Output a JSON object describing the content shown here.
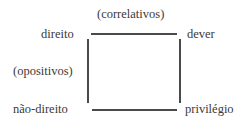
{
  "diagram": {
    "title_top": "(correlativos)",
    "title_left": "(opositivos)",
    "corners": {
      "top_left": "direito",
      "top_right": "dever",
      "bottom_left": "não-direito",
      "bottom_right": "privilégio"
    },
    "line_color": "#4a4a4a",
    "text_color": "#3a3a3a"
  }
}
